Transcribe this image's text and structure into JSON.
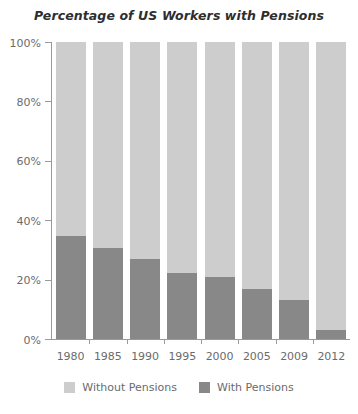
{
  "chart_data": {
    "type": "bar",
    "subtype": "stacked-100-percent",
    "title": "Percentage of US Workers with Pensions",
    "xlabel": "",
    "ylabel": "",
    "categories": [
      "1980",
      "1985",
      "1990",
      "1995",
      "2000",
      "2005",
      "2009",
      "2012"
    ],
    "series": [
      {
        "name": "Without Pensions",
        "color": "#cdcdcd",
        "values": [
          65.3,
          69.4,
          73.1,
          77.8,
          79.1,
          83.2,
          86.9,
          97.0
        ]
      },
      {
        "name": "With Pensions",
        "color": "#888888",
        "values": [
          34.7,
          30.6,
          26.9,
          22.2,
          20.9,
          16.8,
          13.1,
          3.0
        ]
      }
    ],
    "ylim": [
      0,
      100
    ],
    "yticks": [
      0,
      20,
      40,
      60,
      80,
      100
    ],
    "ytick_labels": [
      "0%",
      "20%",
      "40%",
      "60%",
      "80%",
      "100%"
    ],
    "grid": false,
    "legend_position": "bottom",
    "axis_color": "#9a9a9a",
    "tick_label_color": "#6b6b6b",
    "title_color": "#2e2e2e",
    "background": "#ffffff"
  }
}
